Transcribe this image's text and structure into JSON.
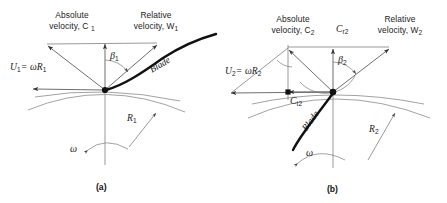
{
  "figure": {
    "background_color": "#ffffff",
    "line_color": "#6f6f6f",
    "blade_color": "#111111"
  },
  "panels": [
    {
      "id": "a",
      "caption": "(a)",
      "station": "1",
      "labels": {
        "absolute_line1": "Absolute",
        "absolute_line2": "velocity, C",
        "absolute_sub": "1",
        "relative_line1": "Relative",
        "relative_line2": "velocity, W",
        "relative_sub": "1",
        "blade_speed": "U",
        "blade_speed_sub": "1",
        "blade_speed_eq": "= ωR",
        "blade_speed_eq_sub": "1",
        "beta": "β",
        "beta_sub": "1",
        "blade": "Blade",
        "radius": "R",
        "radius_sub": "1",
        "omega": "ω"
      },
      "vectors": [
        {
          "name": "C1",
          "label": "Absolute velocity, C1",
          "from": [
            105,
            90
          ],
          "to": [
            47,
            45
          ]
        },
        {
          "name": "Cr1",
          "label": "meridional component",
          "from": [
            105,
            90
          ],
          "to": [
            105,
            43
          ]
        },
        {
          "name": "W1",
          "label": "Relative velocity, W1",
          "from": [
            105,
            90
          ],
          "to": [
            158,
            44
          ]
        },
        {
          "name": "U1",
          "label": "U1 = wR1",
          "from": [
            105,
            90
          ],
          "to": [
            32,
            89
          ]
        }
      ]
    },
    {
      "id": "b",
      "caption": "(b)",
      "station": "2",
      "labels": {
        "absolute_line1": "Absolute",
        "absolute_line2": "velocity, C",
        "absolute_sub": "2",
        "relative_line1": "Relative",
        "relative_line2": "velocity, W",
        "relative_sub": "2",
        "meridional": "C",
        "meridional_sub": "r2",
        "tangential": "C",
        "tangential_sub": "t2",
        "blade_speed": "U",
        "blade_speed_sub": "2",
        "blade_speed_eq": "= ωR",
        "blade_speed_eq_sub": "2",
        "beta": "β",
        "beta_sub": "2",
        "blade": "Blade",
        "radius": "R",
        "radius_sub": "2",
        "omega": "ω"
      },
      "vectors": [
        {
          "name": "C2",
          "label": "Absolute velocity, C2",
          "from": [
            333,
            92
          ],
          "to": [
            288,
            49
          ]
        },
        {
          "name": "Cr2",
          "label": "meridional component",
          "from": [
            333,
            92
          ],
          "to": [
            333,
            48
          ]
        },
        {
          "name": "W2",
          "label": "Relative velocity, W2",
          "from": [
            333,
            92
          ],
          "to": [
            390,
            48
          ]
        },
        {
          "name": "U2",
          "label": "U2 = wR2",
          "from": [
            333,
            92
          ],
          "to": [
            230,
            93
          ]
        },
        {
          "name": "Ct2",
          "label": "tangential component",
          "from": [
            333,
            92
          ],
          "to": [
            288,
            92
          ]
        }
      ]
    }
  ]
}
